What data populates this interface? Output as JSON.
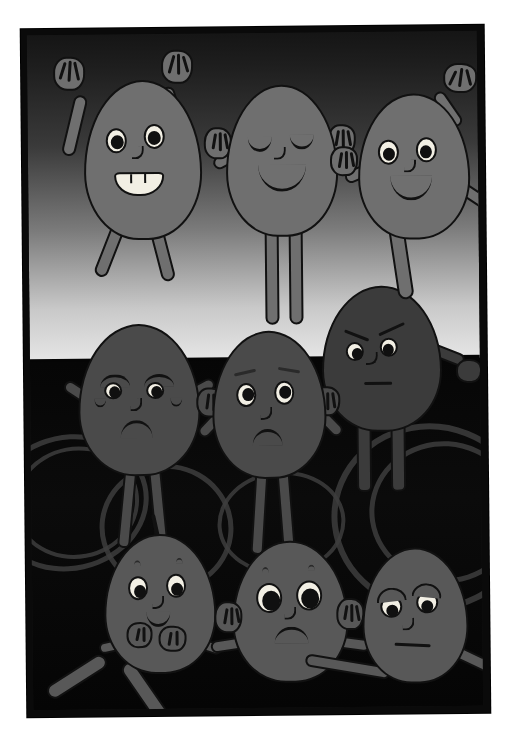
{
  "artwork": {
    "title": "Nine Expressive Characters",
    "medium": "grayscale cartoon illustration",
    "orientation": "portrait",
    "frame": {
      "border_color": "#0a0a0a",
      "rotation_deg": -0.55
    },
    "palette": {
      "background_sky_top": "#151515",
      "background_sky_bottom": "#e6e6e6",
      "ground": "#060606",
      "ring_outline": "#3d3d3d",
      "character_light": "#6f6f6f",
      "character_mid": "#585858",
      "character_dark": "#4a4a4a",
      "character_darker": "#3b3b3b",
      "outline": "#111111",
      "eye_white": "#f2efe4",
      "pupil": "#101010"
    },
    "scene": {
      "background_description": "graded sky from near-black at top to pale grey at the horizon, above a black ground marked with faint grey ring outlines",
      "ring_count": 6
    },
    "rows": [
      {
        "name": "top-row",
        "count": 3
      },
      {
        "name": "middle-row",
        "count": 3
      },
      {
        "name": "bottom-row",
        "count": 3
      }
    ],
    "characters": [
      {
        "id": "top-left",
        "position": "top row, left",
        "expression": "joyful",
        "eyes": "wide open, both pupils looking left",
        "mouth": "open toothy grin",
        "arms": "both raised overhead, fingers splayed",
        "legs": "bent, seated on the head of the character below",
        "tone": "light"
      },
      {
        "id": "top-center",
        "position": "top row, centre",
        "expression": "blissful / content",
        "eyes": "closed, curved downward",
        "mouth": "gentle closed smile",
        "arms": "both raised beside the head, palms forward",
        "legs": "two straight legs standing",
        "tone": "light"
      },
      {
        "id": "top-right",
        "position": "top row, right",
        "expression": "cheerful",
        "eyes": "wide open, pupils looking left",
        "mouth": "small smile",
        "arms": "right arm raised with splayed fingers, left arm lowered waving",
        "legs": "one leg resting on the shoulder below",
        "tone": "light"
      },
      {
        "id": "middle-left",
        "position": "middle row, left",
        "expression": "sad",
        "eyes": "half-lidded, downcast",
        "mouth": "deep frown",
        "arms": "down at the sides",
        "legs": "two thin legs",
        "tone": "dark"
      },
      {
        "id": "middle-center",
        "position": "middle row, centre",
        "expression": "worried",
        "eyes": "wide open, looking up-left",
        "mouth": "frown",
        "arms": "both hands raised beside the face",
        "legs": "two thin legs",
        "tone": "dark"
      },
      {
        "id": "middle-right",
        "position": "middle row, right",
        "expression": "angry",
        "eyes": "narrowed under sharply angled brows",
        "mouth": "flat straight line",
        "arms": "left hand clenched into a fist",
        "legs": "hidden behind the row below",
        "tone": "darker"
      },
      {
        "id": "bottom-left",
        "position": "bottom row, left",
        "expression": "shy / bashful",
        "eyes": "wide open, looking up",
        "mouth": "tiny smile",
        "arms": "hands held together in front of the chest",
        "legs": "crossed and stretched out on the ground",
        "tone": "mid"
      },
      {
        "id": "bottom-center",
        "position": "bottom row, centre",
        "expression": "anxious / shocked",
        "eyes": "very large, dark, staring forward",
        "mouth": "downturned",
        "arms": "both hands pressed to the sides of the head",
        "legs": "folded beneath",
        "tone": "mid"
      },
      {
        "id": "bottom-right",
        "position": "bottom row, right",
        "expression": "gloomy / tired",
        "eyes": "drooping with heavy upper lids",
        "mouth": "flat downturned line",
        "arms": "one arm reaching across the ground",
        "legs": "tucked under",
        "tone": "mid"
      }
    ]
  }
}
